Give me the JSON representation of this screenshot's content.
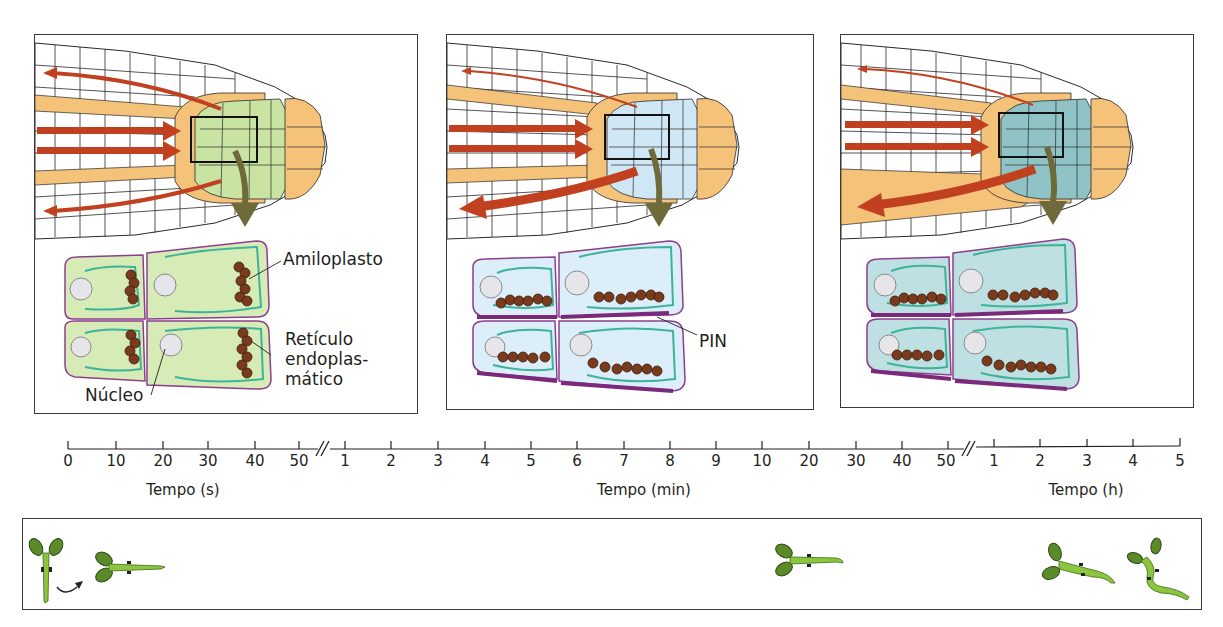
{
  "figure": {
    "type": "gravitropism-root-statolith-diagram",
    "colors": {
      "auxin_arrow": "#c1401f",
      "cap_cell_orange": "#f5c27a",
      "columella_stage1": "#c9e3a2",
      "columella_stage2": "#cfe6f5",
      "columella_stage3": "#8fc3c6",
      "cell_outline_purple": "#8c3f8c",
      "er_teal": "#3fb39a",
      "amyloplast_brown": "#7a3b1c",
      "pin_membrane": "#7b2a7b",
      "seedling_green": "#8cc63f",
      "cotyledon_dark_green": "#5a8a2a",
      "zoom_arrow_olive": "#6e6a3a"
    }
  },
  "panels": [
    {
      "id": "panel-seconds",
      "columella_color": "#c9e3a2",
      "statolith_position": "lateral (original bottom, now side)",
      "labels": {
        "amyloplast": "Amiloplasto",
        "er_line1": "Retículo",
        "er_line2": "endoplas-",
        "er_line3": "mático",
        "nucleus": "Núcleo"
      }
    },
    {
      "id": "panel-minutes",
      "columella_color": "#cfe6f5",
      "statolith_position": "sedimented to new bottom",
      "labels": {
        "pin": "PIN"
      }
    },
    {
      "id": "panel-hours",
      "columella_color": "#8fc3c6",
      "statolith_position": "sedimented to new bottom",
      "labels": {}
    }
  ],
  "timeline": {
    "segments": [
      {
        "unit_label": "Tempo (s)",
        "ticks": [
          "0",
          "10",
          "20",
          "30",
          "40",
          "50"
        ]
      },
      {
        "unit_label": "Tempo (min)",
        "ticks": [
          "1",
          "2",
          "3",
          "4",
          "5",
          "6",
          "7",
          "8",
          "9",
          "10",
          "20",
          "30",
          "40",
          "50"
        ]
      },
      {
        "unit_label": "Tempo (h)",
        "ticks": [
          "1",
          "2",
          "3",
          "4",
          "5"
        ]
      }
    ],
    "break_symbol": "//"
  },
  "seedlings": {
    "items": [
      {
        "stage": "vertical",
        "description": "upright seedling"
      },
      {
        "stage": "rotation-arrow",
        "description": "curved arrow indicating 90° rotation"
      },
      {
        "stage": "horizontal-0s",
        "description": "seedling laid horizontal, straight root"
      },
      {
        "stage": "horizontal-min",
        "description": "root tip beginning to bend downward"
      },
      {
        "stage": "horizontal-h1",
        "description": "root bending down, shoot lifting"
      },
      {
        "stage": "horizontal-h5",
        "description": "root curved strongly down, shoot upright"
      }
    ]
  }
}
